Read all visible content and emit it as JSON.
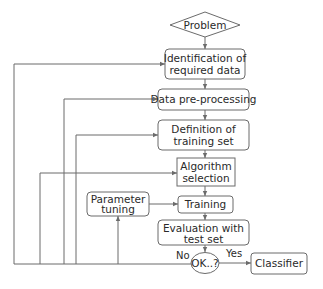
{
  "diagram": {
    "type": "flowchart",
    "nodes": [
      {
        "id": "problem",
        "shape": "diamond",
        "lines": [
          "Problem"
        ]
      },
      {
        "id": "identification",
        "shape": "rounded-rect",
        "lines": [
          "Identification of",
          "required data"
        ]
      },
      {
        "id": "preprocessing",
        "shape": "rounded-rect",
        "lines": [
          "Data pre-processing"
        ]
      },
      {
        "id": "definition",
        "shape": "rounded-rect",
        "lines": [
          "Definition of",
          "training set"
        ]
      },
      {
        "id": "algorithm",
        "shape": "rect",
        "lines": [
          "Algorithm",
          "selection"
        ]
      },
      {
        "id": "parameter",
        "shape": "rounded-rect",
        "lines": [
          "Parameter",
          "tuning"
        ]
      },
      {
        "id": "training",
        "shape": "rounded-rect",
        "lines": [
          "Training"
        ]
      },
      {
        "id": "evaluation",
        "shape": "rounded-rect",
        "lines": [
          "Evaluation with",
          "test set"
        ]
      },
      {
        "id": "ok",
        "shape": "ellipse",
        "lines": [
          "OK..?"
        ]
      },
      {
        "id": "classifier",
        "shape": "rounded-rect",
        "lines": [
          "Classifier"
        ]
      }
    ],
    "edges": [
      {
        "from": "problem",
        "to": "identification",
        "label": ""
      },
      {
        "from": "identification",
        "to": "preprocessing",
        "label": ""
      },
      {
        "from": "preprocessing",
        "to": "definition",
        "label": ""
      },
      {
        "from": "definition",
        "to": "algorithm",
        "label": ""
      },
      {
        "from": "algorithm",
        "to": "training",
        "label": ""
      },
      {
        "from": "parameter",
        "to": "training",
        "label": ""
      },
      {
        "from": "training",
        "to": "evaluation",
        "label": ""
      },
      {
        "from": "evaluation",
        "to": "ok",
        "label": ""
      },
      {
        "from": "ok",
        "to": "classifier",
        "label": "Yes"
      },
      {
        "from": "ok",
        "to": "identification",
        "label": "No"
      },
      {
        "from": "ok",
        "to": "preprocessing",
        "label": "No"
      },
      {
        "from": "ok",
        "to": "definition",
        "label": "No"
      },
      {
        "from": "ok",
        "to": "algorithm",
        "label": "No"
      },
      {
        "from": "ok",
        "to": "parameter",
        "label": "No"
      }
    ],
    "labels": {
      "no": "No",
      "yes": "Yes"
    }
  }
}
